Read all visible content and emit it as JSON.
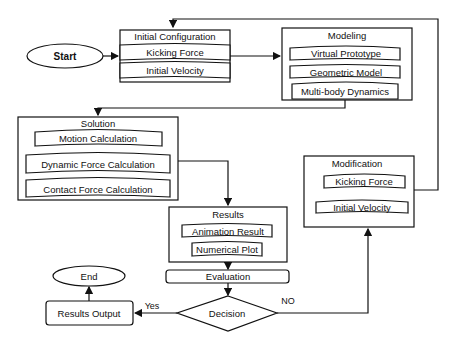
{
  "diagram": {
    "start": {
      "label": "Start"
    },
    "end": {
      "label": "End"
    },
    "initial_configuration": {
      "title": "Initial Configuration",
      "items": [
        "Kicking Force",
        "Initial Velocity"
      ]
    },
    "modeling": {
      "title": "Modeling",
      "items": [
        "Virtual Prototype",
        "Geometric Model",
        "Multi-body Dynamics"
      ]
    },
    "solution": {
      "title": "Solution",
      "items": [
        "Motion Calculation",
        "Dynamic Force Calculation",
        "Contact Force Calculation"
      ]
    },
    "results": {
      "title": "Results",
      "items": [
        "Animation Result",
        "Numerical Plot"
      ]
    },
    "evaluation": {
      "label": "Evaluation"
    },
    "decision": {
      "label": "Decision"
    },
    "results_output": {
      "label": "Results Output"
    },
    "modification": {
      "title": "Modification",
      "items": [
        "Kicking Force",
        "Initial Velocity"
      ]
    },
    "edge_labels": {
      "yes": "Yes",
      "no": "NO"
    }
  }
}
